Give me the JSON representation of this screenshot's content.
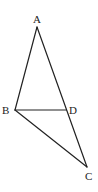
{
  "diagram": {
    "type": "geometry-triangle",
    "colors": {
      "line": "#222222",
      "background": "#ffffff"
    },
    "points": {
      "A": {
        "label": "A",
        "x": 37,
        "y": 27,
        "lx": 33,
        "ly": 23
      },
      "B": {
        "label": "B",
        "x": 15,
        "y": 110,
        "lx": 2,
        "ly": 114
      },
      "D": {
        "label": "D",
        "x": 66,
        "y": 110,
        "lx": 69,
        "ly": 114
      },
      "C": {
        "label": "C",
        "x": 87,
        "y": 167,
        "lx": 85,
        "ly": 180
      }
    },
    "segments": [
      {
        "name": "segment-AB",
        "from": "A",
        "to": "B"
      },
      {
        "name": "segment-AC",
        "from": "A",
        "to": "C"
      },
      {
        "name": "segment-BD",
        "from": "B",
        "to": "D"
      },
      {
        "name": "segment-BC",
        "from": "B",
        "to": "C"
      }
    ]
  }
}
